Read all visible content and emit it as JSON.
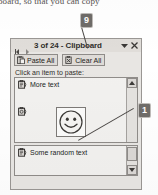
{
  "document": {
    "cropped_line": "board, so that you can copy"
  },
  "callouts": [
    {
      "id": "9",
      "label": "9"
    },
    {
      "id": "1",
      "label": "1"
    }
  ],
  "pane": {
    "title": "3 of 24 - Clipboard",
    "nav": {
      "back_icon": "left-arrow-icon",
      "forward_icon": "right-arrow-icon"
    },
    "menu_icon": "chevron-down-icon",
    "close_icon": "close-icon",
    "toolbar": {
      "paste_all_label": "Paste All",
      "paste_all_icon": "clipboard-paste-icon",
      "clear_all_label": "Clear All",
      "clear_all_icon": "clipboard-clear-icon"
    },
    "hint": "Click an item to paste:",
    "items": [
      {
        "icon": "clipboard-item-icon",
        "label": "More text",
        "type": "text"
      },
      {
        "icon": "clipboard-item-icon",
        "label": "",
        "type": "image",
        "image": "smiley-face"
      },
      {
        "icon": "clipboard-item-icon",
        "label": "Some random text",
        "type": "text"
      }
    ],
    "scrollbar": {
      "up_icon": "scroll-up-arrow-icon",
      "down_icon": "scroll-down-arrow-icon"
    }
  },
  "colors": {
    "pane_bg": "#e8e6e3",
    "list_bg": "#f2f1ef",
    "border": "#9a9794",
    "callout_bg": "#6f6c69",
    "text": "#201e1c"
  }
}
